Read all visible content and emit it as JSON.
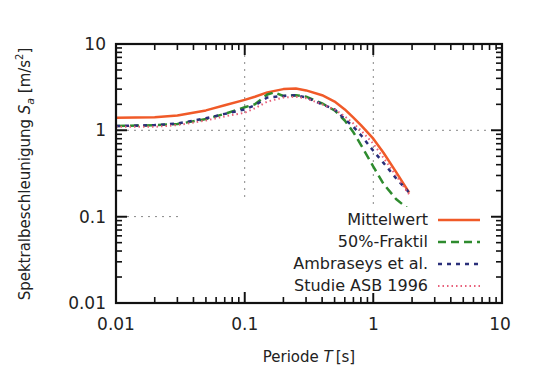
{
  "chart_data": {
    "type": "line",
    "title": "",
    "xlabel": "Periode T [s]",
    "ylabel": "Spektralbeschleunigung S_a [m/s^2]",
    "xlabel_parts": {
      "main": "Periode ",
      "var": "T",
      "unit": "[s]"
    },
    "ylabel_parts": {
      "main": "Spektralbeschleunigung ",
      "var": "S",
      "sub": "a",
      "unit_open": " [m/s",
      "sup": "2",
      "unit_close": "]"
    },
    "xscale": "log",
    "yscale": "log",
    "xlim": [
      0.01,
      10
    ],
    "ylim": [
      0.01,
      10
    ],
    "x_ticks": [
      "0.01",
      "0.1",
      "1",
      "10"
    ],
    "y_ticks": [
      "0.01",
      "0.1",
      "1",
      "10"
    ],
    "grid": "partial dotted at x=0.1, x=1, y=1, y=0.1",
    "legend_position": "lower right inside",
    "series": [
      {
        "name": "Mittelwert",
        "color": "#f05a28",
        "style": "solid",
        "x": [
          0.01,
          0.02,
          0.03,
          0.05,
          0.07,
          0.1,
          0.12,
          0.15,
          0.2,
          0.25,
          0.3,
          0.4,
          0.5,
          0.6,
          0.7,
          0.8,
          1.0,
          1.2,
          1.5,
          1.9
        ],
        "y": [
          1.4,
          1.42,
          1.48,
          1.7,
          1.95,
          2.25,
          2.45,
          2.75,
          3.0,
          3.05,
          2.9,
          2.55,
          2.15,
          1.75,
          1.4,
          1.15,
          0.8,
          0.55,
          0.33,
          0.19
        ]
      },
      {
        "name": "50%-Fraktil",
        "color": "#2e8b2e",
        "style": "dashed",
        "x": [
          0.01,
          0.02,
          0.03,
          0.05,
          0.07,
          0.1,
          0.12,
          0.15,
          0.17,
          0.2,
          0.25,
          0.3,
          0.4,
          0.5,
          0.6,
          0.7,
          0.8,
          1.0,
          1.2,
          1.5,
          1.9
        ],
        "y": [
          1.12,
          1.15,
          1.18,
          1.35,
          1.55,
          1.85,
          2.0,
          2.6,
          2.75,
          2.5,
          2.55,
          2.45,
          2.05,
          1.7,
          1.3,
          0.95,
          0.68,
          0.38,
          0.24,
          0.16,
          0.12
        ]
      },
      {
        "name": "Ambraseys et al.",
        "color": "#2a2f7a",
        "style": "dashed-short",
        "x": [
          0.01,
          0.02,
          0.03,
          0.05,
          0.07,
          0.1,
          0.12,
          0.15,
          0.2,
          0.25,
          0.3,
          0.4,
          0.5,
          0.6,
          0.7,
          0.8,
          1.0,
          1.2,
          1.5,
          1.9
        ],
        "y": [
          1.12,
          1.15,
          1.2,
          1.38,
          1.55,
          1.75,
          1.95,
          2.4,
          2.5,
          2.55,
          2.4,
          2.0,
          1.75,
          1.35,
          1.1,
          0.88,
          0.58,
          0.42,
          0.28,
          0.19
        ]
      },
      {
        "name": "Studie ASB 1996",
        "color": "#e8607a",
        "style": "dotted",
        "x": [
          0.01,
          0.02,
          0.03,
          0.05,
          0.07,
          0.1,
          0.12,
          0.15,
          0.2,
          0.25,
          0.3,
          0.4,
          0.5,
          0.6,
          0.7,
          0.8,
          1.0,
          1.2,
          1.5,
          1.9
        ],
        "y": [
          1.1,
          1.1,
          1.15,
          1.3,
          1.45,
          1.6,
          1.8,
          2.15,
          2.4,
          2.45,
          2.35,
          2.0,
          1.75,
          1.45,
          1.2,
          1.0,
          0.7,
          0.48,
          0.3,
          0.18
        ]
      }
    ]
  },
  "legend": [
    {
      "label": "Mittelwert"
    },
    {
      "label": "50%-Fraktil"
    },
    {
      "label": "Ambraseys et al."
    },
    {
      "label": "Studie ASB 1996"
    }
  ]
}
